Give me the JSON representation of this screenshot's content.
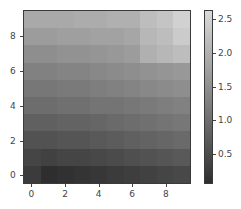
{
  "chart_data": {
    "type": "heatmap",
    "title": "",
    "xlabel": "",
    "ylabel": "",
    "colormap": "gray",
    "origin": "lower",
    "x_ticks": [
      "0",
      "2",
      "4",
      "6",
      "8"
    ],
    "y_ticks": [
      "0",
      "2",
      "4",
      "6",
      "8"
    ],
    "xlim": [
      -0.5,
      9.5
    ],
    "ylim": [
      -0.5,
      9.5
    ],
    "colorbar": {
      "ticks": [
        "0.5",
        "1.0",
        "1.5",
        "2.0",
        "2.5"
      ],
      "vmin": 0.06,
      "vmax": 2.63
    },
    "rows_y": [
      0,
      1,
      2,
      3,
      4,
      5,
      6,
      7,
      8,
      9
    ],
    "cols_x": [
      0,
      1,
      2,
      3,
      4,
      5,
      6,
      7,
      8,
      9
    ],
    "values": [
      [
        0.25,
        0.06,
        0.1,
        0.15,
        0.2,
        0.25,
        0.3,
        0.35,
        0.4,
        0.45
      ],
      [
        0.4,
        0.35,
        0.4,
        0.4,
        0.45,
        0.5,
        0.55,
        0.6,
        0.65,
        0.7
      ],
      [
        0.6,
        0.6,
        0.65,
        0.65,
        0.7,
        0.75,
        0.8,
        0.85,
        0.9,
        0.95
      ],
      [
        0.8,
        0.8,
        0.85,
        0.85,
        0.9,
        0.95,
        1.0,
        1.05,
        1.1,
        1.15
      ],
      [
        1.0,
        1.0,
        1.05,
        1.05,
        1.1,
        1.1,
        1.15,
        1.2,
        1.25,
        1.3
      ],
      [
        1.15,
        1.15,
        1.2,
        1.2,
        1.25,
        1.3,
        1.35,
        1.4,
        1.45,
        1.5
      ],
      [
        1.3,
        1.3,
        1.35,
        1.35,
        1.4,
        1.45,
        1.5,
        1.55,
        1.6,
        1.65
      ],
      [
        1.5,
        1.5,
        1.55,
        1.55,
        1.6,
        1.65,
        1.7,
        2.0,
        2.1,
        2.2
      ],
      [
        1.7,
        1.7,
        1.75,
        1.75,
        1.8,
        1.8,
        1.85,
        2.1,
        2.2,
        2.4
      ],
      [
        1.9,
        1.9,
        1.9,
        1.95,
        1.95,
        2.0,
        2.0,
        2.2,
        2.3,
        2.5
      ]
    ]
  }
}
